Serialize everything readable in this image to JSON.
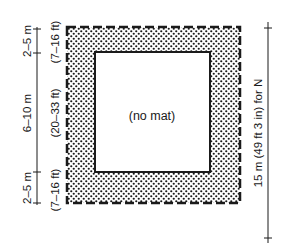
{
  "diagram": {
    "center_label": "(no mat)",
    "left_dimensions": [
      {
        "metric": "2–5 m",
        "imperial": "(7–16 ft)"
      },
      {
        "metric": "6–10 m",
        "imperial": "(20–33 ft)"
      },
      {
        "metric": "2–5 m",
        "imperial": "(7–16 ft)"
      }
    ],
    "right_dimension": "15 m (49 ft 3 in) for N",
    "colors": {
      "ink": "#1a1a1a",
      "background": "#ffffff"
    }
  }
}
